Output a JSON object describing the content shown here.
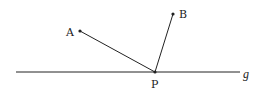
{
  "diagram": {
    "colors": {
      "stroke": "#222222",
      "background": "#ffffff"
    },
    "line": {
      "label": "g",
      "x1": 16,
      "y1": 72,
      "x2": 240,
      "y2": 72
    },
    "points": [
      {
        "label": "A",
        "x": 80,
        "y": 31
      },
      {
        "label": "B",
        "x": 173,
        "y": 14
      },
      {
        "label": "P",
        "x": 155,
        "y": 72
      }
    ],
    "segments": [
      {
        "from": "A",
        "to": "P"
      },
      {
        "from": "B",
        "to": "P"
      }
    ]
  }
}
